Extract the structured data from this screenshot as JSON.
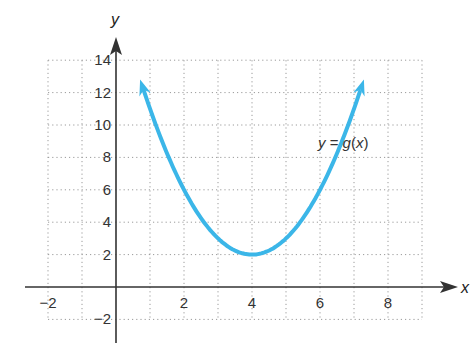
{
  "chart_data": {
    "type": "line",
    "title": "",
    "xlabel": "x",
    "ylabel": "y",
    "xlim": [
      -2,
      9
    ],
    "ylim": [
      -2,
      14
    ],
    "grid": true,
    "grid_style": "dotted",
    "x_ticks": [
      -2,
      2,
      4,
      6,
      8
    ],
    "x_tick_labels": [
      "−2",
      "2",
      "4",
      "6",
      "8"
    ],
    "y_ticks": [
      -2,
      2,
      4,
      6,
      8,
      10,
      12,
      14
    ],
    "y_tick_labels": [
      "−2",
      "2",
      "4",
      "6",
      "8",
      "10",
      "12",
      "14"
    ],
    "series": [
      {
        "name": "y = g(x)",
        "color": "#3bb6e8",
        "vertex": [
          4,
          2
        ],
        "arrows_both_ends": true,
        "x": [
          0.6,
          1,
          1.5,
          2,
          2.5,
          3,
          3.5,
          4,
          4.5,
          5,
          5.5,
          6,
          6.5,
          7,
          7.4
        ],
        "y": [
          13.56,
          11,
          8.25,
          6,
          4.25,
          3,
          2.25,
          2,
          2.25,
          3,
          4.25,
          6,
          8.25,
          11,
          13.56
        ]
      }
    ],
    "annotations": [
      {
        "text": "y = g(x)",
        "x": 6.3,
        "y": 9
      }
    ]
  },
  "labels": {
    "x_axis": "x",
    "y_axis": "y",
    "curve_y": "y",
    "curve_eq": " = ",
    "curve_g": "g",
    "curve_open": "(",
    "curve_x": "x",
    "curve_close": ")"
  },
  "colors": {
    "curve": "#3bb6e8",
    "axis": "#333333",
    "grid": "#9a9a9a"
  }
}
